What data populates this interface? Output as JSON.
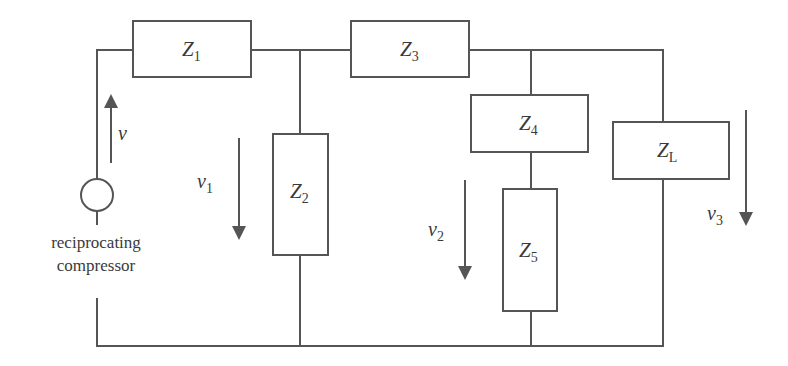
{
  "diagram": {
    "type": "circuit",
    "components": [
      {
        "id": "Z1",
        "symbol": "Z",
        "subscript": "1"
      },
      {
        "id": "Z2",
        "symbol": "Z",
        "subscript": "2"
      },
      {
        "id": "Z3",
        "symbol": "Z",
        "subscript": "3"
      },
      {
        "id": "Z4",
        "symbol": "Z",
        "subscript": "4"
      },
      {
        "id": "Z5",
        "symbol": "Z",
        "subscript": "5"
      },
      {
        "id": "ZL",
        "symbol": "Z",
        "subscript": "L"
      }
    ],
    "voltages": [
      {
        "id": "v",
        "symbol": "v",
        "subscript": "",
        "direction": "up"
      },
      {
        "id": "v1",
        "symbol": "v",
        "subscript": "1",
        "direction": "down"
      },
      {
        "id": "v2",
        "symbol": "v",
        "subscript": "2",
        "direction": "down"
      },
      {
        "id": "v3",
        "symbol": "v",
        "subscript": "3",
        "direction": "down"
      }
    ],
    "source": {
      "label_line1": "reciprocating",
      "label_line2": "compressor"
    },
    "colors": {
      "line": "#555555",
      "text": "#3a3a3a",
      "background": "#ffffff"
    }
  }
}
